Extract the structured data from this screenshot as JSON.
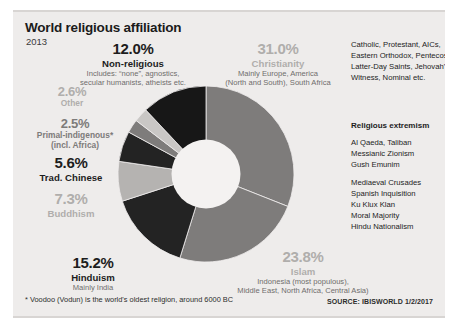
{
  "header": {
    "title": "World religious affiliation",
    "year": "2013"
  },
  "footer": {
    "footnote": "* Voodoo (Vodun) is the world's oldest religion, around 6000 BC",
    "source": "SOURCE: IBISWORLD 1/2/2017"
  },
  "denominations": {
    "lines": [
      "Catholic,  Protestant, AICs,",
      "Eastern Orthodox, Pentecostal,",
      "Latter-Day Saints, Jehovah's",
      "Witness, Nominal etc."
    ]
  },
  "extremism": {
    "heading": "Religious extremism",
    "group1": [
      "Al Qaeda, Taliban",
      "Messianic Zionism",
      "Gush Emunim"
    ],
    "group2": [
      "Mediaeval Crusades",
      "Spanish Inquisition",
      "Ku Klux Klan",
      "Moral Majority",
      "Hindu Nationalism"
    ]
  },
  "labels": {
    "nonreligious": {
      "pct": "12.0%",
      "name": "Non-religious",
      "desc_1": "Includes: “none”, agnostics,",
      "desc_2": "secular humanists, atheists etc."
    },
    "other": {
      "pct": "2.6%",
      "name": "Other"
    },
    "primal": {
      "pct": "2.5%",
      "name": "Primal-indigenous*",
      "desc_1": "(incl. Africa)"
    },
    "chinese": {
      "pct": "5.6%",
      "name": "Trad. Chinese"
    },
    "buddhism": {
      "pct": "7.3%",
      "name": "Buddhism"
    },
    "hinduism": {
      "pct": "15.2%",
      "name": "Hinduism",
      "desc_1": "Mainly India"
    },
    "christianity": {
      "pct": "31.0%",
      "name": "Christianity",
      "desc_1": "Mainly Europe, America",
      "desc_2": "(North and South), South Africa"
    },
    "islam": {
      "pct": "23.8%",
      "name": "Islam",
      "desc_1": "Indonesia (most populous),",
      "desc_2": "Middle East, North Africa, Central Asia)"
    }
  },
  "chart_data": {
    "type": "pie",
    "title": "World religious affiliation",
    "subtitle": "2013",
    "donut": true,
    "inner_radius_ratio": 0.385,
    "start_angle_deg": 0,
    "direction": "clockwise",
    "legend": "labels placed around chart",
    "categories": [
      "Christianity",
      "Islam",
      "Hinduism",
      "Buddhism",
      "Trad. Chinese",
      "Primal-indigenous",
      "Other",
      "Non-religious"
    ],
    "values": [
      31.0,
      23.8,
      15.2,
      7.3,
      5.6,
      2.5,
      2.6,
      12.0
    ],
    "colors": [
      "#7e7c7b",
      "#7e7c7b",
      "#232323",
      "#b5b3b1",
      "#232323",
      "#7e7c7b",
      "#c9c7c5",
      "#171717"
    ],
    "unit": "percent",
    "total": 100.0
  }
}
